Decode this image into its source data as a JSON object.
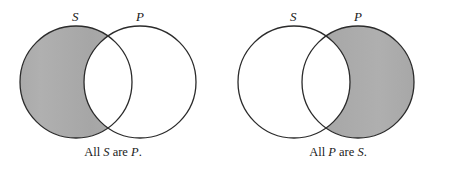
{
  "figure": {
    "background_color": "#ffffff",
    "outline_color": "#2b2b2b",
    "shade_color": "#a9a9a9",
    "unshaded_color": "#ffffff",
    "diagram_type": "venn-two-circle-categorical-syllogism"
  },
  "diagrams": [
    {
      "id": "all-s-are-p",
      "left_circle_label": "S",
      "right_circle_label": "P",
      "shaded_region": "S-minus-P",
      "overlap_region_fill": "unshaded",
      "caption_prefix": "All ",
      "caption_subject": "S",
      "caption_middle": " are ",
      "caption_predicate": "P",
      "caption_suffix": ".",
      "caption_full": "All S are P."
    },
    {
      "id": "all-p-are-s",
      "left_circle_label": "S",
      "right_circle_label": "P",
      "shaded_region": "P-minus-S",
      "overlap_region_fill": "unshaded",
      "caption_prefix": "All ",
      "caption_subject": "P",
      "caption_middle": " are ",
      "caption_predicate": "S",
      "caption_suffix": ".",
      "caption_full": "All P are S."
    }
  ]
}
